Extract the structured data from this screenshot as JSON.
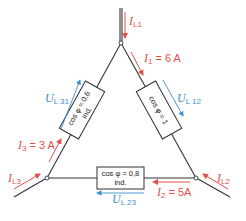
{
  "diagram": {
    "type": "delta-connection-circuit",
    "colors": {
      "current": "#e0524a",
      "voltage": "#3a8fd0",
      "wire": "#333333"
    },
    "nodes": {
      "L1": [
        121,
        43
      ],
      "L2": [
        196,
        178
      ],
      "L3": [
        47,
        178
      ]
    },
    "currents": {
      "IL1": {
        "symbol": "I",
        "sub": "L1",
        "value": ""
      },
      "IL2": {
        "symbol": "I",
        "sub": "L2",
        "value": ""
      },
      "IL3": {
        "symbol": "I",
        "sub": "L3",
        "value": ""
      },
      "I1": {
        "symbol": "I",
        "sub": "1",
        "value": " = 6 A"
      },
      "I2": {
        "symbol": "I",
        "sub": "2",
        "value": " = 5A"
      },
      "I3": {
        "symbol": "I",
        "sub": "3",
        "value": " = 3 A"
      }
    },
    "voltages": {
      "UL12": {
        "symbol": "U",
        "sub": "L 12"
      },
      "UL23": {
        "symbol": "U",
        "sub": "L 23"
      },
      "UL31": {
        "symbol": "U",
        "sub": "L 31"
      }
    },
    "loads": {
      "load12": {
        "line1": "cos φ = 1",
        "line2": ""
      },
      "load23": {
        "line1": "cos φ = 0,8",
        "line2": "ind."
      },
      "load31": {
        "line1": "cos φ = 0,6",
        "line2": "ind."
      }
    }
  }
}
